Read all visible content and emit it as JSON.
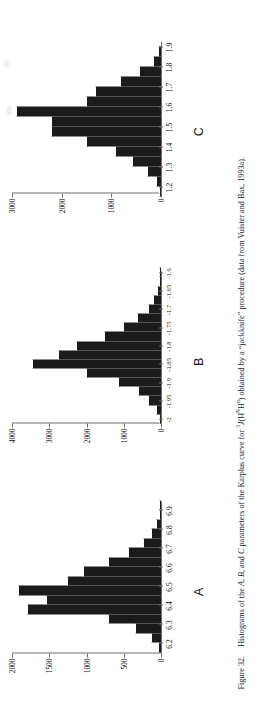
{
  "figure": {
    "number": "Figure 32.",
    "caption_parts": {
      "p1": "Histograms of the ",
      "i1": "A",
      "p2": ", ",
      "i2": "B",
      "p3": ", and ",
      "i3": "C",
      "p4": " parameters of the Karplus curve for ",
      "sup1": "3",
      "i4": "J",
      "p5": "(H",
      "sup2": "N",
      "p6": "H",
      "sup3": "α",
      "p7": ") obtained by a “jackknife” procedure (data from Vuister and Bax, 1993a)."
    },
    "caption_plain": "Figure 32.   Histograms of the A, B, and C parameters of the Karplus curve for 3J(HNHα) obtained by a “jackknife” procedure (data from Vuister and Bax, 1993a).",
    "ink_color": "#1b1b1b",
    "axis_color": "#6e6e6e",
    "paper_color": "#ffffff"
  },
  "chart_data": [
    {
      "type": "bar",
      "panel": "A",
      "title": "A",
      "xlabel": "",
      "ylabel": "",
      "orientation": "vertical",
      "grid": false,
      "legend": null,
      "ylim": [
        0,
        2000
      ],
      "yticks": [
        0,
        500,
        1000,
        1500,
        2000
      ],
      "ytick_labels": [
        "0",
        "500",
        "1000",
        "1500",
        "2000"
      ],
      "xlim": [
        6.15,
        6.95
      ],
      "xticks": [
        6.2,
        6.3,
        6.4,
        6.5,
        6.6,
        6.7,
        6.8,
        6.9
      ],
      "xtick_labels": [
        "6.2",
        "6.3",
        "6.4",
        "6.5",
        "6.6",
        "6.7",
        "6.8",
        "6.9"
      ],
      "bin_width": 0.05,
      "categories": [
        "6.175",
        "6.225",
        "6.275",
        "6.325",
        "6.375",
        "6.425",
        "6.475",
        "6.525",
        "6.575",
        "6.625",
        "6.675",
        "6.725",
        "6.775",
        "6.825",
        "6.875",
        "6.925"
      ],
      "values": [
        30,
        120,
        330,
        700,
        1780,
        1530,
        1900,
        1250,
        1030,
        700,
        430,
        230,
        120,
        60,
        20,
        10
      ]
    },
    {
      "type": "bar",
      "panel": "B",
      "title": "B",
      "xlabel": "",
      "ylabel": "",
      "orientation": "vertical",
      "grid": false,
      "legend": null,
      "ylim": [
        0,
        4000
      ],
      "yticks": [
        0,
        1000,
        2000,
        3000,
        4000
      ],
      "ytick_labels": [
        "0",
        "1000",
        "2000",
        "3000",
        "4000"
      ],
      "xlim": [
        -2.01,
        -1.595
      ],
      "xticks": [
        -2,
        -1.95,
        -1.9,
        -1.85,
        -1.8,
        -1.75,
        -1.7,
        -1.65,
        -1.6
      ],
      "xtick_labels": [
        "-2",
        "-1.95",
        "-1.9",
        "-1.85",
        "-1.7",
        "-1.65",
        "-1.6"
      ],
      "xtick_labels_all": [
        "-2",
        "-1.95",
        "-1.9",
        "-1.85",
        "-1.8",
        "-1.75",
        "-1.7",
        "-1.65",
        "-1.6"
      ],
      "bin_width": 0.025,
      "categories": [
        "-2.0",
        "-1.975",
        "-1.95",
        "-1.925",
        "-1.9",
        "-1.875",
        "-1.85",
        "-1.825",
        "-1.8",
        "-1.775",
        "-1.75",
        "-1.725",
        "-1.7",
        "-1.675",
        "-1.65",
        "-1.625",
        "-1.6"
      ],
      "values": [
        40,
        110,
        330,
        600,
        1120,
        2000,
        3450,
        2750,
        2250,
        1500,
        1000,
        620,
        330,
        180,
        90,
        40,
        15
      ]
    },
    {
      "type": "bar",
      "panel": "C",
      "title": "C",
      "xlabel": "",
      "ylabel": "",
      "orientation": "vertical",
      "grid": false,
      "legend": null,
      "ylim": [
        0,
        3000
      ],
      "yticks": [
        0,
        1000,
        2000,
        3000
      ],
      "ytick_labels": [
        "0",
        "1000",
        "2000",
        "3000"
      ],
      "xlim": [
        1.17,
        1.93
      ],
      "xticks": [
        1.2,
        1.3,
        1.4,
        1.5,
        1.6,
        1.7,
        1.8,
        1.9
      ],
      "xtick_labels": [
        "1.2",
        "1.3",
        "1.4",
        "1.5",
        "1.6",
        "1.7",
        "1.8",
        "1.9"
      ],
      "bin_width": 0.05,
      "categories": [
        "1.175",
        "1.225",
        "1.275",
        "1.325",
        "1.375",
        "1.425",
        "1.475",
        "1.525",
        "1.575",
        "1.625",
        "1.675",
        "1.725",
        "1.775",
        "1.825",
        "1.875"
      ],
      "values": [
        30,
        90,
        270,
        560,
        900,
        1500,
        2200,
        2200,
        2900,
        1500,
        1300,
        800,
        420,
        150,
        40
      ]
    }
  ]
}
